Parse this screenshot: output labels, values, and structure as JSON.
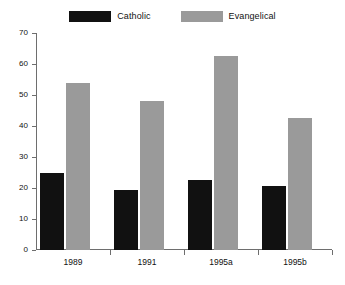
{
  "chart_data": {
    "type": "bar",
    "title": "",
    "subtitle": "",
    "xlabel": "",
    "ylabel": "",
    "categories": [
      "1989",
      "1991",
      "1995a",
      "1995b"
    ],
    "series": [
      {
        "name": "Catholic",
        "color": "#111111",
        "values": [
          25,
          19.5,
          22.5,
          20.5
        ]
      },
      {
        "name": "Evangelical",
        "color": "#9a9a9a",
        "values": [
          54,
          48,
          62.5,
          42.5
        ]
      }
    ],
    "ylim": [
      0,
      70
    ],
    "yticks": [
      0,
      10,
      20,
      30,
      40,
      50,
      60,
      70
    ],
    "ytick_labels": [
      "0",
      "10",
      "20",
      "30",
      "40",
      "50",
      "60",
      "70"
    ],
    "grid": false,
    "legend_position": "top-center",
    "legend_entries": [
      "Catholic",
      "Evangelical"
    ],
    "annotations": []
  },
  "colors": {
    "catholic": "#111111",
    "evangelical": "#9a9a9a",
    "axis": "#6e6e6e",
    "background": "#ffffff",
    "text": "#111111"
  }
}
